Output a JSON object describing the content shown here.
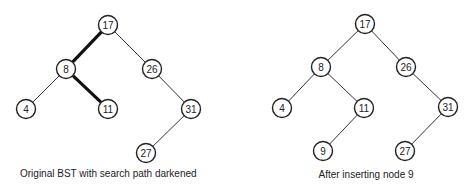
{
  "diagrams": [
    {
      "id": "left",
      "caption": "Original BST with search path darkened",
      "nodes": [
        {
          "key": "17",
          "x": 108,
          "y": 25
        },
        {
          "key": "8",
          "x": 66,
          "y": 69
        },
        {
          "key": "26",
          "x": 152,
          "y": 69
        },
        {
          "key": "4",
          "x": 26,
          "y": 109
        },
        {
          "key": "11",
          "x": 108,
          "y": 109
        },
        {
          "key": "31",
          "x": 191,
          "y": 109
        },
        {
          "key": "27",
          "x": 146,
          "y": 153
        }
      ],
      "edges": [
        {
          "from": "17",
          "to": "8",
          "dark": true
        },
        {
          "from": "17",
          "to": "26",
          "dark": false
        },
        {
          "from": "8",
          "to": "4",
          "dark": false
        },
        {
          "from": "8",
          "to": "11",
          "dark": true
        },
        {
          "from": "26",
          "to": "31",
          "dark": false
        },
        {
          "from": "31",
          "to": "27",
          "dark": false
        }
      ]
    },
    {
      "id": "right",
      "caption": "After inserting node 9",
      "nodes": [
        {
          "key": "17",
          "x": 365,
          "y": 24
        },
        {
          "key": "8",
          "x": 321,
          "y": 67
        },
        {
          "key": "26",
          "x": 406,
          "y": 67
        },
        {
          "key": "4",
          "x": 282,
          "y": 108
        },
        {
          "key": "11",
          "x": 364,
          "y": 108
        },
        {
          "key": "31",
          "x": 448,
          "y": 107
        },
        {
          "key": "9",
          "x": 323,
          "y": 151
        },
        {
          "key": "27",
          "x": 405,
          "y": 151
        }
      ],
      "edges": [
        {
          "from": "17",
          "to": "8",
          "dark": false
        },
        {
          "from": "17",
          "to": "26",
          "dark": false
        },
        {
          "from": "8",
          "to": "4",
          "dark": false
        },
        {
          "from": "8",
          "to": "11",
          "dark": false
        },
        {
          "from": "26",
          "to": "31",
          "dark": false
        },
        {
          "from": "11",
          "to": "9",
          "dark": false
        },
        {
          "from": "31",
          "to": "27",
          "dark": false
        }
      ]
    }
  ]
}
